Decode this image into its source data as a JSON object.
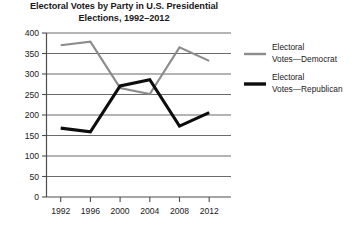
{
  "chart_data": {
    "type": "line",
    "title": "Electoral Votes by Party in U.S. Presidential Elections, 1992–2012",
    "title_line1": "Electoral Votes by Party in U.S. Presidential",
    "title_line2": "Elections, 1992–2012",
    "xlabel": "",
    "ylabel": "",
    "categories": [
      "1992",
      "1996",
      "2000",
      "2004",
      "2008",
      "2012"
    ],
    "x": [
      1992,
      1996,
      2000,
      2004,
      2008,
      2012
    ],
    "ylim": [
      0,
      400
    ],
    "ytick_step": 50,
    "yticks": [
      "400",
      "350",
      "300",
      "250",
      "200",
      "150",
      "100",
      "50",
      "0"
    ],
    "ytick_values": [
      400,
      350,
      300,
      250,
      200,
      150,
      100,
      50,
      0
    ],
    "grid": true,
    "legend_position": "right",
    "series": [
      {
        "name": "Electoral Votes—Democrat",
        "name_line1": "Electoral",
        "name_line2": "Votes—Democrat",
        "color": "#8c8c8c",
        "values": [
          370,
          379,
          266,
          251,
          365,
          332
        ]
      },
      {
        "name": "Electoral Votes—Republican",
        "name_line1": "Electoral",
        "name_line2": "Votes—Republican",
        "color": "#0d0d0d",
        "values": [
          168,
          159,
          271,
          286,
          173,
          206
        ]
      }
    ]
  }
}
